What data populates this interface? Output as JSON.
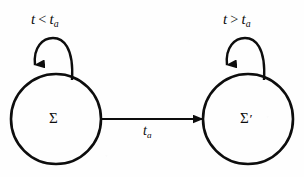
{
  "figure": {
    "type": "state-transition-diagram",
    "background_color": "#fefefe",
    "stroke_color": "#0d0d0d",
    "width": 304,
    "height": 177
  },
  "states": [
    {
      "id": "sigma",
      "label": "Σ",
      "prime": "",
      "cx": 56,
      "cy": 119,
      "r": 45
    },
    {
      "id": "sigma-prime",
      "label": "Σ",
      "prime": "′",
      "cx": 248,
      "cy": 119,
      "r": 45
    }
  ],
  "self_loops": [
    {
      "id": "loop-sigma",
      "state": "sigma",
      "condition_var": "t",
      "condition_relation": "<",
      "condition_bound": "t",
      "condition_subscript": "a",
      "label_x": 31,
      "label_y": 12
    },
    {
      "id": "loop-sigma-prime",
      "state": "sigma-prime",
      "condition_var": "t",
      "condition_relation": ">",
      "condition_bound": "t",
      "condition_subscript": "a",
      "label_x": 223,
      "label_y": 12
    }
  ],
  "transition": {
    "id": "sigma-to-sigma-prime",
    "from": "sigma",
    "to": "sigma-prime",
    "label_var": "t",
    "label_subscript": "a",
    "label_x": 143,
    "label_y": 124,
    "x1": 101,
    "x2": 204,
    "y": 119
  }
}
